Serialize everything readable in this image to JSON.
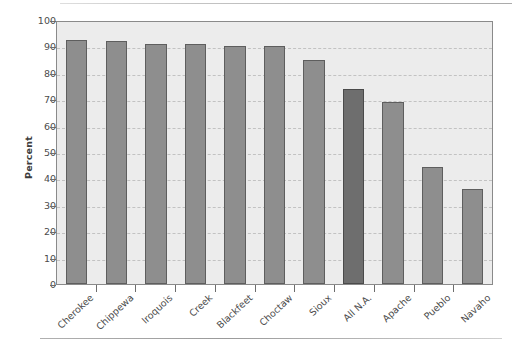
{
  "chart_data": {
    "type": "bar",
    "title": "",
    "xlabel": "",
    "ylabel": "Percent",
    "ylim": [
      0,
      100
    ],
    "ytick_step": 10,
    "yticks": [
      0,
      10,
      20,
      30,
      40,
      50,
      60,
      70,
      80,
      90,
      100
    ],
    "grid": true,
    "legend": "none",
    "categories": [
      "Cherokee",
      "Chippewa",
      "Iroquois",
      "Creek",
      "Blackfeet",
      "Choctaw",
      "Sioux",
      "All N.A.",
      "Apache",
      "Pueblo",
      "Navaho"
    ],
    "values": [
      92.5,
      92,
      91,
      91,
      90,
      90,
      85,
      74,
      69,
      44.5,
      36
    ],
    "highlight_category": "All N.A.",
    "colors": {
      "bar": "#8e8e8e",
      "bar_highlight": "#6e6e6e",
      "bar_edge": "#5e5e5e",
      "plot_background": "#ececec",
      "grid_line": "#c2c2c2",
      "axis": "#8a8a8a",
      "text": "#4b4b4b"
    }
  }
}
